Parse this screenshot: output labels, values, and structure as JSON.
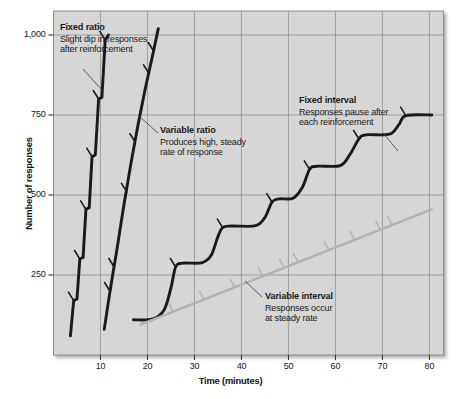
{
  "figure": {
    "background": "#ffffff",
    "plot_background": "#d6d6d6",
    "grid_color": "#9a9a9a",
    "curve_color": "#1a1a1a",
    "variable_interval_color": "#b3b3b3"
  },
  "chart_data": {
    "type": "line",
    "title": "",
    "xlabel": "Time (minutes)",
    "ylabel": "Number of responses",
    "xlim": [
      0,
      83
    ],
    "ylim": [
      0,
      1075
    ],
    "xticks": [
      "10",
      "20",
      "30",
      "40",
      "50",
      "60",
      "70",
      "80"
    ],
    "xtick_values": [
      10,
      20,
      30,
      40,
      50,
      60,
      70,
      80
    ],
    "yticks": [
      "250",
      "500",
      "750",
      "1,000"
    ],
    "ytick_values": [
      250,
      500,
      750,
      1000
    ],
    "grid": true,
    "legend_position": "inline-annotations",
    "series": [
      {
        "name": "Fixed ratio",
        "color": "#1a1a1a",
        "style": "stepped-steep",
        "points": [
          [
            3.6,
            60
          ],
          [
            4.3,
            170
          ],
          [
            5.0,
            175
          ],
          [
            5.6,
            300
          ],
          [
            6.3,
            305
          ],
          [
            6.9,
            455
          ],
          [
            7.6,
            460
          ],
          [
            8.2,
            620
          ],
          [
            8.9,
            625
          ],
          [
            9.6,
            800
          ],
          [
            10.3,
            805
          ],
          [
            11.0,
            985
          ],
          [
            11.7,
            1000
          ]
        ],
        "reinforcement_marks": [
          [
            4.3,
            170
          ],
          [
            5.6,
            300
          ],
          [
            6.9,
            455
          ],
          [
            8.2,
            620
          ],
          [
            9.6,
            800
          ],
          [
            11.0,
            985
          ]
        ]
      },
      {
        "name": "Variable ratio",
        "color": "#1a1a1a",
        "style": "steady-steep",
        "points": [
          [
            10.8,
            80
          ],
          [
            12.2,
            215
          ],
          [
            13.5,
            330
          ],
          [
            15.0,
            470
          ],
          [
            16.5,
            600
          ],
          [
            18.0,
            720
          ],
          [
            19.5,
            830
          ],
          [
            21.0,
            930
          ],
          [
            22.3,
            1020
          ]
        ],
        "reinforcement_marks": [
          [
            12.0,
            200
          ],
          [
            12.9,
            275
          ],
          [
            15.6,
            510
          ],
          [
            17.4,
            665
          ],
          [
            20.3,
            880
          ],
          [
            21.3,
            950
          ]
        ]
      },
      {
        "name": "Fixed interval",
        "color": "#1a1a1a",
        "style": "scalloped",
        "points": [
          [
            17.0,
            110
          ],
          [
            21.0,
            112
          ],
          [
            23.5,
            140
          ],
          [
            25.0,
            210
          ],
          [
            26.0,
            275
          ],
          [
            27.5,
            287
          ],
          [
            31.5,
            288
          ],
          [
            33.5,
            310
          ],
          [
            35.0,
            370
          ],
          [
            36.0,
            398
          ],
          [
            38.0,
            403
          ],
          [
            43.0,
            404
          ],
          [
            45.0,
            430
          ],
          [
            46.5,
            478
          ],
          [
            48.0,
            488
          ],
          [
            51.0,
            490
          ],
          [
            53.0,
            525
          ],
          [
            54.5,
            580
          ],
          [
            56.0,
            590
          ],
          [
            61.0,
            592
          ],
          [
            63.0,
            625
          ],
          [
            65.0,
            675
          ],
          [
            66.5,
            688
          ],
          [
            71.5,
            690
          ],
          [
            73.5,
            720
          ],
          [
            75.0,
            748
          ],
          [
            80.5,
            750
          ]
        ],
        "reinforcement_marks": [
          [
            26.0,
            275
          ],
          [
            36.0,
            398
          ],
          [
            46.5,
            478
          ],
          [
            54.5,
            580
          ],
          [
            65.0,
            675
          ],
          [
            75.0,
            748
          ]
        ]
      },
      {
        "name": "Variable interval",
        "color": "#b3b3b3",
        "style": "straight",
        "points": [
          [
            18.5,
            95
          ],
          [
            80.5,
            455
          ]
        ],
        "reinforcement_marks": [
          [
            25.5,
            135
          ],
          [
            32.0,
            175
          ],
          [
            38.5,
            212
          ],
          [
            44.5,
            248
          ],
          [
            49.0,
            275
          ],
          [
            52.0,
            292
          ],
          [
            58.5,
            330
          ],
          [
            64.0,
            362
          ],
          [
            69.5,
            393
          ],
          [
            72.0,
            408
          ]
        ]
      }
    ]
  },
  "annotations": [
    {
      "id": "fixed-ratio",
      "title": "Fixed ratio",
      "description": "Slight dip in responses\nafter reinforcement"
    },
    {
      "id": "variable-ratio",
      "title": "Variable ratio",
      "description": "Produces high, steady\nrate of response"
    },
    {
      "id": "fixed-interval",
      "title": "Fixed interval",
      "description": "Responses pause after\neach reinforcement"
    },
    {
      "id": "variable-interval",
      "title": "Variable interval",
      "description": "Responses occur\nat steady rate"
    }
  ]
}
